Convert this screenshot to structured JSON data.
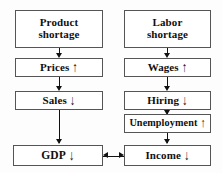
{
  "diagram": {
    "background_color": "#fdfdfd",
    "border_color": "#555555",
    "arrow_color": "#111111",
    "text_color": "#101010",
    "arrow_up": "↑",
    "arrow_down": "↓",
    "arrow_up_double": "↑"
  },
  "left_column": {
    "nodes": [
      {
        "id": "product-shortage",
        "line1": "Product",
        "line2": "shortage",
        "arrow": ""
      },
      {
        "id": "prices",
        "line1": "Prices",
        "line2": "",
        "arrow": "↑"
      },
      {
        "id": "sales",
        "line1": "Sales",
        "line2": "",
        "arrow": "↓"
      },
      {
        "id": "gdp",
        "line1": "GDP",
        "line2": "",
        "arrow": "↓"
      }
    ]
  },
  "right_column": {
    "nodes": [
      {
        "id": "labor-shortage",
        "line1": "Labor",
        "line2": "shortage",
        "arrow": ""
      },
      {
        "id": "wages",
        "line1": "Wages",
        "line2": "",
        "arrow": "↑"
      },
      {
        "id": "hiring",
        "line1": "Hiring",
        "line2": "",
        "arrow": "↓"
      },
      {
        "id": "unemployment",
        "line1": "Unemployment",
        "line2": "",
        "arrow": "↑"
      },
      {
        "id": "income",
        "line1": "Income",
        "line2": "",
        "arrow": "↓"
      }
    ]
  },
  "edges": [
    {
      "id": "product-to-prices",
      "from": "product-shortage",
      "to": "prices",
      "direction": "down"
    },
    {
      "id": "prices-to-sales",
      "from": "prices",
      "to": "sales",
      "direction": "down"
    },
    {
      "id": "sales-to-gdp",
      "from": "sales",
      "to": "gdp",
      "direction": "down"
    },
    {
      "id": "labor-to-wages",
      "from": "labor-shortage",
      "to": "wages",
      "direction": "down"
    },
    {
      "id": "wages-to-hiring",
      "from": "wages",
      "to": "hiring",
      "direction": "down"
    },
    {
      "id": "hiring-to-unemployment",
      "from": "hiring",
      "to": "unemployment",
      "direction": "down"
    },
    {
      "id": "unemployment-to-income",
      "from": "unemployment",
      "to": "income",
      "direction": "down"
    },
    {
      "id": "income-to-gdp",
      "from": "income",
      "to": "gdp",
      "direction": "left"
    }
  ]
}
